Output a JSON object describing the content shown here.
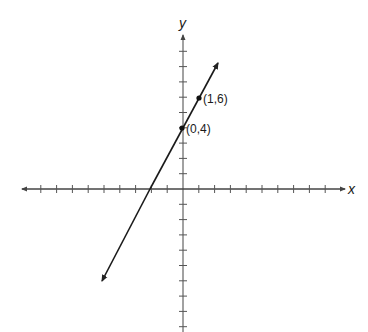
{
  "chart_data": {
    "type": "line",
    "title": "",
    "xlabel": "x",
    "ylabel": "y",
    "xlim": [
      -10,
      10
    ],
    "ylim": [
      -9,
      10
    ],
    "grid": false,
    "series": [
      {
        "name": "line through (0,4) and (1,6)",
        "x": [
          -5,
          2.3
        ],
        "y": [
          -6,
          8.6
        ],
        "slope": 2,
        "intercept": 4
      }
    ],
    "points": [
      {
        "x": 0,
        "y": 4,
        "label": "(0,4)"
      },
      {
        "x": 1,
        "y": 6,
        "label": "(1,6)"
      }
    ],
    "annotations": [
      "(0,4)",
      "(1,6)"
    ]
  },
  "labels": {
    "x_axis": "x",
    "y_axis": "y",
    "point_a": "(0,4)",
    "point_b": "(1,6)"
  },
  "colors": {
    "axis": "#333333",
    "line": "#1a1a1a"
  }
}
